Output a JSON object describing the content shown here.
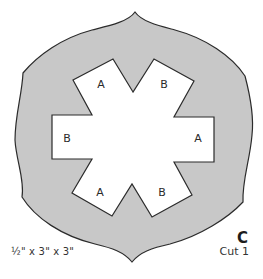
{
  "pattern": {
    "piece_letter": "C",
    "cut_instruction": "Cut 1",
    "dimensions": "½\" x 3\" x 3\"",
    "colors": {
      "outer_fill": "#c8c8c8",
      "outline": "#2b2b2b",
      "inner_fill": "#ffffff"
    },
    "tabs": [
      {
        "position": "top-left",
        "label": "A"
      },
      {
        "position": "top-right",
        "label": "B"
      },
      {
        "position": "left",
        "label": "B"
      },
      {
        "position": "right",
        "label": "A"
      },
      {
        "position": "bottom-left",
        "label": "A"
      },
      {
        "position": "bottom-right",
        "label": "B"
      }
    ]
  }
}
